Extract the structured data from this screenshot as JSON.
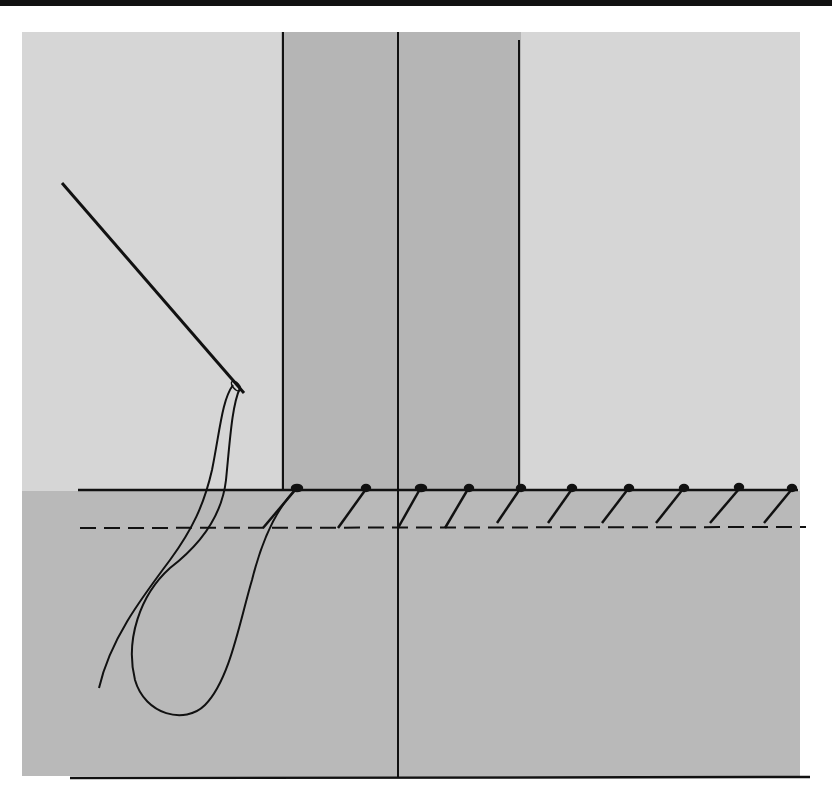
{
  "diagram": {
    "title": "",
    "colors": {
      "background": "#ffffff",
      "top_bar": "#111111",
      "upper_fabric": "#d6d6d6",
      "band": "#b4b4b4",
      "lower_fabric": "#b8b8b8",
      "line": "#111111"
    },
    "elements": {
      "needle": "needle-icon",
      "thread": "thread-loop",
      "stitches_count": 10
    },
    "labels": []
  }
}
